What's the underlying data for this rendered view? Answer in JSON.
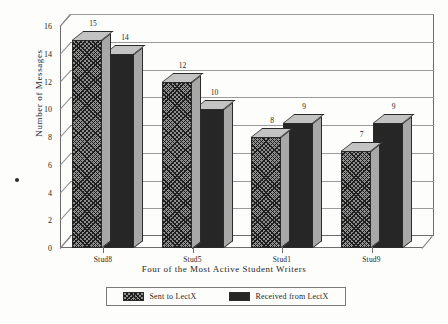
{
  "chart_data": {
    "type": "bar",
    "title": "",
    "xlabel": "Four of the Most Active Student Writers",
    "ylabel": "Number of Messages",
    "categories": [
      "Stud8",
      "Stud5",
      "Stud1",
      "Stud9"
    ],
    "series": [
      {
        "name": "Sent to LectX",
        "values": [
          15,
          12,
          8,
          7
        ],
        "swatch": "hatched"
      },
      {
        "name": "Received from LectX",
        "values": [
          14,
          10,
          9,
          9
        ],
        "swatch": "solid"
      }
    ],
    "ylim": [
      0,
      16
    ],
    "yticks": [
      0,
      2,
      4,
      6,
      8,
      10,
      12,
      14,
      16
    ],
    "grid": true,
    "legend_position": "bottom",
    "style": "3d-grouped-bar",
    "colors": {
      "hatched_fill": "#8e8e8e",
      "solid_fill": "#262626",
      "bar_top": "#c3c3c3",
      "bar_side": "#a8a8a8",
      "axis": "#6b6b6b",
      "gridline": "#9a9a9a",
      "text": "#1f1f1f",
      "background": "#fdfdfc"
    }
  },
  "marker": {
    "bullet": "•"
  }
}
